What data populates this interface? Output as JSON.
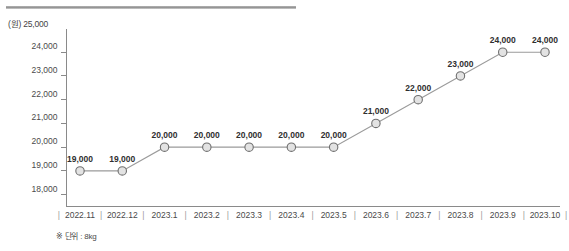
{
  "chart_data": {
    "type": "line",
    "title": "",
    "subtitle": "",
    "xlabel": "",
    "ylabel": "(원)",
    "y_unit_label": "(원)",
    "categories": [
      "2022.11",
      "2022.12",
      "2023.1",
      "2023.2",
      "2023.3",
      "2023.4",
      "2023.5",
      "2023.6",
      "2023.7",
      "2023.8",
      "2023.9",
      "2023.10"
    ],
    "values": [
      19000,
      19000,
      20000,
      20000,
      20000,
      20000,
      20000,
      21000,
      22000,
      23000,
      24000,
      24000
    ],
    "point_labels": [
      "19,000",
      "19,000",
      "20,000",
      "20,000",
      "20,000",
      "20,000",
      "20,000",
      "21,000",
      "22,000",
      "23,000",
      "24,000",
      "24,000"
    ],
    "ylim": [
      17500,
      25000
    ],
    "yticks": [
      18000,
      19000,
      20000,
      21000,
      22000,
      23000,
      24000,
      25000
    ],
    "ytick_labels": [
      "18,000",
      "19,000",
      "20,000",
      "21,000",
      "22,000",
      "23,000",
      "24,000",
      "25,000"
    ],
    "grid": false,
    "legend": null,
    "series": [
      {
        "name": "가격",
        "values": [
          19000,
          19000,
          20000,
          20000,
          20000,
          20000,
          20000,
          21000,
          22000,
          23000,
          24000,
          24000
        ]
      }
    ],
    "marker_color": "#e3e3e3",
    "marker_edge_color": "#6f6f6f",
    "line_color": "#9b9b9b",
    "x_separator": "|"
  },
  "footnote": {
    "text": "※ 단위 : 8kg"
  },
  "decor": {
    "top_rule_color": "#8f8f8f"
  }
}
